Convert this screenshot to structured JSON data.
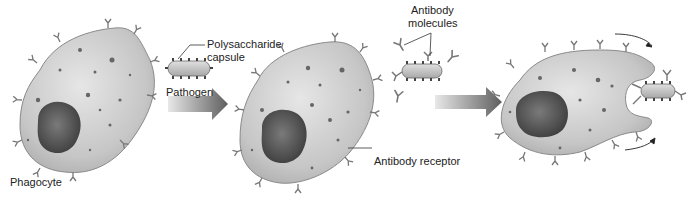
{
  "diagram": {
    "type": "process",
    "stages": [
      {
        "id": "stage-1",
        "elements": [
          "Phagocyte",
          "Pathogen"
        ]
      },
      {
        "id": "stage-2",
        "elements": [
          "Phagocyte with antibody receptors",
          "Antibody molecules bound to pathogen"
        ]
      },
      {
        "id": "stage-3",
        "elements": [
          "Phagocyte engulfing antibody-coated pathogen"
        ]
      }
    ],
    "arrows": [
      {
        "from": "stage-1",
        "to": "stage-2"
      },
      {
        "from": "stage-2",
        "to": "stage-3"
      }
    ]
  },
  "labels": {
    "phagocyte": "Phagocyte",
    "polysaccharide_line1": "Polysaccharide",
    "polysaccharide_line2": "capsule",
    "pathogen": "Pathogen",
    "antibody_line1": "Antibody",
    "antibody_line2": "molecules",
    "antibody_receptor": "Antibody receptor"
  },
  "colors": {
    "cell_fill": "#c9c9c9",
    "cell_stroke": "#8a8a8a",
    "nucleus": "#5a5a5a",
    "arrow": "#6e6e6e",
    "text": "#222222"
  }
}
